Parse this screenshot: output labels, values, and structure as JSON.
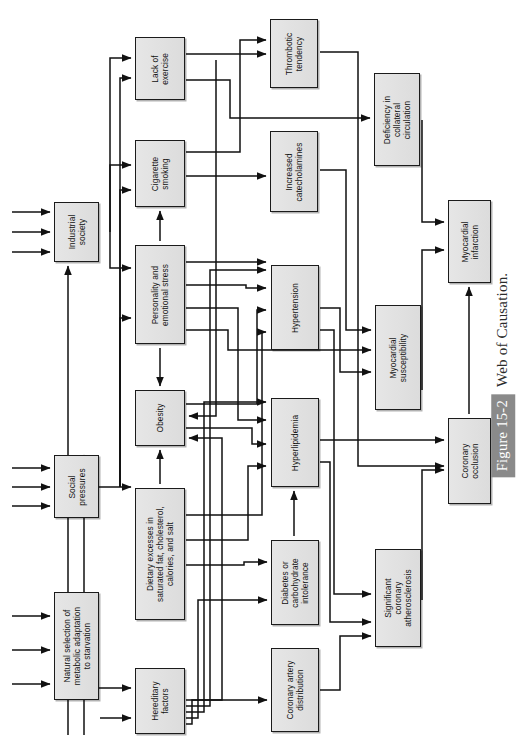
{
  "figure": {
    "number_badge": "Figure 15-2",
    "caption": "Web of Causation.",
    "orientation": "rotated-90-ccw",
    "badge_color": "#8a8a8a",
    "box_fill": "#e2e2e2",
    "box_border": "#1b1b1b"
  },
  "nodes": [
    {
      "id": "lack-of-exercise",
      "label": "Lack of\nexercise",
      "x": 135,
      "y": 37,
      "w": 50,
      "h": 63
    },
    {
      "id": "cigarette-smoking",
      "label": "Cigarette\nsmoking",
      "x": 135,
      "y": 140,
      "w": 50,
      "h": 67
    },
    {
      "id": "industrial-society",
      "label": "Industrial\nsociety",
      "x": 54,
      "y": 202,
      "w": 45,
      "h": 60
    },
    {
      "id": "personality-stress",
      "label": "Personality and\nemotional stress",
      "x": 135,
      "y": 245,
      "w": 50,
      "h": 99
    },
    {
      "id": "obesity",
      "label": "Obesity",
      "x": 135,
      "y": 390,
      "w": 50,
      "h": 56
    },
    {
      "id": "social-pressures",
      "label": "Social\npressures",
      "x": 54,
      "y": 455,
      "w": 45,
      "h": 63
    },
    {
      "id": "dietary-excesses",
      "label": "Dietary excesses in\nsaturated fat, cholesterol,\ncalories, and salt",
      "x": 135,
      "y": 488,
      "w": 50,
      "h": 132
    },
    {
      "id": "natural-selection",
      "label": "Natural selection of\nmetabolic adaptation\nto starvation",
      "x": 54,
      "y": 592,
      "w": 45,
      "h": 108
    },
    {
      "id": "hereditary-factors",
      "label": "Hereditary\nfactors",
      "x": 135,
      "y": 668,
      "w": 50,
      "h": 66
    },
    {
      "id": "thrombotic-tendency",
      "label": "Thrombotic\ntendency",
      "x": 270,
      "y": 19,
      "w": 48,
      "h": 69
    },
    {
      "id": "increased-catecholamines",
      "label": "Increased\ncatecholamines",
      "x": 270,
      "y": 131,
      "w": 48,
      "h": 81
    },
    {
      "id": "hypertension",
      "label": "Hypertension",
      "x": 271,
      "y": 265,
      "w": 48,
      "h": 85
    },
    {
      "id": "hyperlipidemia",
      "label": "Hyperlipidemia",
      "x": 271,
      "y": 398,
      "w": 48,
      "h": 89
    },
    {
      "id": "diabetes-carbohydrate",
      "label": "Diabetes or\ncarbohydrate\nintolerance",
      "x": 271,
      "y": 540,
      "w": 48,
      "h": 85
    },
    {
      "id": "coronary-artery-distribution",
      "label": "Coronary artery\ndistribution",
      "x": 271,
      "y": 648,
      "w": 48,
      "h": 84
    },
    {
      "id": "deficiency-collateral",
      "label": "Deficiency in\ncollateral\ncirculation",
      "x": 374,
      "y": 73,
      "w": 46,
      "h": 93
    },
    {
      "id": "myocardial-susceptibility",
      "label": "Myocardial\nsusceptibility",
      "x": 375,
      "y": 305,
      "w": 46,
      "h": 105
    },
    {
      "id": "significant-coronary-atherosclerosis",
      "label": "Significant\ncoronary\natherosclerosis",
      "x": 375,
      "y": 549,
      "w": 46,
      "h": 98
    },
    {
      "id": "myocardial-infarction",
      "label": "Myocardial\ninfarction",
      "x": 448,
      "y": 200,
      "w": 43,
      "h": 83
    },
    {
      "id": "coronary-occlusion",
      "label": "Coronary\nocclusion",
      "x": 448,
      "y": 418,
      "w": 43,
      "h": 86
    }
  ],
  "edges_description": [
    "three unlabeled inputs -> industrial society",
    "three unlabeled inputs -> social pressures",
    "three unlabeled inputs -> natural selection of metabolic adaptation to starvation",
    "one unlabeled input -> hereditary factors",
    "industrial society -> lack of exercise, cigarette smoking, personality and emotional stress",
    "social pressures -> lack of exercise, cigarette smoking, personality and emotional stress, dietary excesses",
    "natural selection -> hereditary factors",
    "personality and emotional stress -> cigarette smoking, obesity, increased catecholamines, hypertension, hyperlipidemia, myocardial susceptibility",
    "dietary excesses -> obesity, hyperlipidemia, diabetes",
    "hereditary factors -> obesity, hypertension, hyperlipidemia, diabetes, coronary artery distribution",
    "lack of exercise -> thrombotic tendency, deficiency in collateral circulation, obesity",
    "cigarette smoking -> thrombotic tendency, increased catecholamines, deficiency in collateral circulation",
    "increased catecholamines -> myocardial susceptibility",
    "hypertension -> significant coronary atherosclerosis, myocardial susceptibility",
    "hyperlipidemia -> significant coronary atherosclerosis, coronary occlusion",
    "diabetes or carbohydrate intolerance -> hyperlipidemia",
    "coronary artery distribution -> significant coronary atherosclerosis",
    "thrombotic tendency -> coronary occlusion",
    "significant coronary atherosclerosis -> coronary occlusion",
    "deficiency in collateral circulation -> myocardial infarction",
    "myocardial susceptibility -> myocardial infarction",
    "coronary occlusion -> myocardial infarction"
  ]
}
